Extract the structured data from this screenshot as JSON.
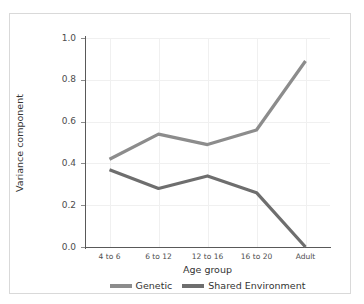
{
  "chart_data": {
    "type": "line",
    "title": "",
    "subtitle": "",
    "xlabel": "Age group",
    "ylabel": "Variance component",
    "categories": [
      "4 to 6",
      "6 to 12",
      "12 to 16",
      "16 to 20",
      "Adult"
    ],
    "ylim": [
      0.0,
      1.0
    ],
    "yticks": [
      "0.0",
      "0.2",
      "0.4",
      "0.6",
      "0.8",
      "1.0"
    ],
    "ytick_values": [
      0.0,
      0.2,
      0.4,
      0.6,
      0.8,
      1.0
    ],
    "grid": true,
    "legend_position": "bottom",
    "series": [
      {
        "name": "Genetic",
        "color": "#8c8c8c",
        "values": [
          0.42,
          0.54,
          0.49,
          0.56,
          0.89
        ]
      },
      {
        "name": "Shared Environment",
        "color": "#6e6e6e",
        "values": [
          0.37,
          0.28,
          0.34,
          0.26,
          0.0
        ]
      }
    ]
  },
  "style": {
    "frame_color": "#d9d9d9",
    "axis_color": "#595959",
    "grid_color": "#f0f0f0",
    "background": "#ffffff",
    "tick_label_color": "#4d4d4d",
    "axis_title_color": "#333333"
  }
}
